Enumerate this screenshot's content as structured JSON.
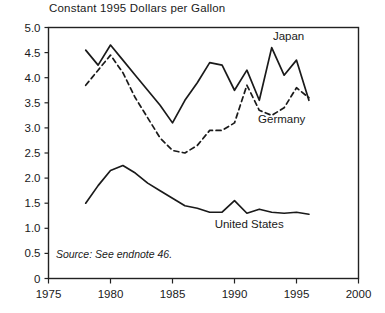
{
  "chart_data": {
    "type": "line",
    "title": "Constant 1995 Dollars per Gallon",
    "xlabel": "",
    "ylabel": "",
    "xlim": [
      1975,
      2000
    ],
    "ylim": [
      0,
      5.0
    ],
    "grid": false,
    "legend_position": "inline-annotations",
    "xticks": [
      1975,
      1980,
      1985,
      1990,
      1995,
      2000
    ],
    "xtick_labels": [
      "1975",
      "1980",
      "1985",
      "1990",
      "1995",
      "2000"
    ],
    "yticks": [
      0,
      0.5,
      1.0,
      1.5,
      2.0,
      2.5,
      3.0,
      3.5,
      4.0,
      4.5,
      5.0
    ],
    "ytick_labels": [
      "0",
      "0.5",
      "1.0",
      "1.5",
      "2.0",
      "2.5",
      "3.0",
      "3.5",
      "4.0",
      "4.5",
      "5.0"
    ],
    "series": [
      {
        "name": "Japan",
        "style": "solid",
        "x": [
          1978,
          1979,
          1980,
          1981,
          1982,
          1983,
          1984,
          1985,
          1986,
          1987,
          1988,
          1989,
          1990,
          1991,
          1992,
          1993,
          1994,
          1995,
          1996
        ],
        "values": [
          4.55,
          4.25,
          4.65,
          4.35,
          4.05,
          3.75,
          3.45,
          3.1,
          3.55,
          3.9,
          4.3,
          4.25,
          3.75,
          4.15,
          3.55,
          4.6,
          4.05,
          4.35,
          3.55
        ]
      },
      {
        "name": "Germany",
        "style": "dashed",
        "x": [
          1978,
          1979,
          1980,
          1981,
          1982,
          1983,
          1984,
          1985,
          1986,
          1987,
          1988,
          1989,
          1990,
          1991,
          1992,
          1993,
          1994,
          1995,
          1996
        ],
        "values": [
          3.85,
          4.15,
          4.45,
          4.1,
          3.6,
          3.2,
          2.8,
          2.55,
          2.5,
          2.65,
          2.95,
          2.95,
          3.1,
          3.85,
          3.35,
          3.25,
          3.4,
          3.8,
          3.6
        ]
      },
      {
        "name": "United States",
        "style": "solid",
        "x": [
          1978,
          1979,
          1980,
          1981,
          1982,
          1983,
          1984,
          1985,
          1986,
          1987,
          1988,
          1989,
          1990,
          1991,
          1992,
          1993,
          1994,
          1995,
          1996
        ],
        "values": [
          1.5,
          1.85,
          2.15,
          2.25,
          2.1,
          1.9,
          1.75,
          1.6,
          1.45,
          1.4,
          1.32,
          1.32,
          1.55,
          1.3,
          1.38,
          1.32,
          1.3,
          1.32,
          1.28
        ]
      }
    ],
    "annotations": [
      {
        "text": "Japan",
        "x": 1993.1,
        "y": 4.75
      },
      {
        "text": "Germany",
        "x": 1991.9,
        "y": 3.1
      },
      {
        "text": "United States",
        "x": 1988.4,
        "y": 1.0
      },
      {
        "text": "Source: See endnote 46.",
        "x": 1975.6,
        "y": 0.4
      }
    ]
  },
  "colors": {
    "line": "#1a1a1a",
    "axis": "#222222",
    "background": "#ffffff",
    "text": "#1a1a1a"
  }
}
